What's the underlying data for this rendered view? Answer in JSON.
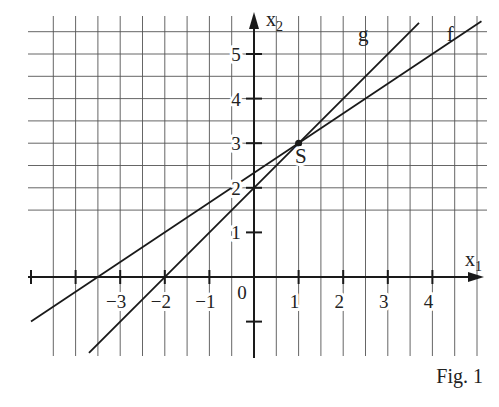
{
  "chart_data": {
    "type": "line",
    "title": "",
    "caption": "Fig. 1",
    "xlabel": "x",
    "xlabel_sub": "1",
    "ylabel": "x",
    "ylabel_sub": "2",
    "origin_label": "0",
    "xlim": [
      -5,
      5.25
    ],
    "ylim": [
      -1.75,
      5.9
    ],
    "grid": true,
    "grid_step": 0.5,
    "x_ticks": [
      -5,
      -4,
      -3,
      -2,
      -1,
      1,
      2,
      3,
      4
    ],
    "x_tick_labels": [
      {
        "value": -3,
        "text": "−3"
      },
      {
        "value": -2,
        "text": "−2"
      },
      {
        "value": -1,
        "text": "−1"
      },
      {
        "value": 1,
        "text": "1"
      },
      {
        "value": 2,
        "text": "2"
      },
      {
        "value": 3,
        "text": "3"
      },
      {
        "value": 4,
        "text": "4"
      }
    ],
    "y_ticks": [
      -1,
      1,
      2,
      3,
      4,
      5
    ],
    "y_tick_labels": [
      {
        "value": 1,
        "text": "1"
      },
      {
        "value": 2,
        "text": "2"
      },
      {
        "value": 3,
        "text": "3"
      },
      {
        "value": 4,
        "text": "4"
      },
      {
        "value": 5,
        "text": "5"
      }
    ],
    "series": [
      {
        "name": "f",
        "slope": 0.6667,
        "intercept": 2.3333,
        "x_range": [
          -5,
          5.1
        ],
        "label_at": [
          4.4,
          5.3
        ]
      },
      {
        "name": "g",
        "slope": 1,
        "intercept": 2,
        "x_range": [
          -3.7,
          3.7
        ],
        "label_at": [
          2.45,
          5.3
        ]
      }
    ],
    "points": [
      {
        "name": "S",
        "x": 1,
        "y": 3,
        "label_at": [
          1.05,
          2.55
        ]
      }
    ]
  }
}
